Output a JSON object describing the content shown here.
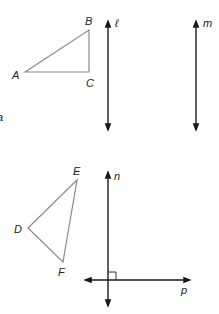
{
  "figure": {
    "width": 219,
    "height": 314,
    "colors": {
      "triangle_stroke": "#8a8a8a",
      "line_stroke": "#1a1a1a",
      "label": "#222222",
      "background": "#ffffff"
    },
    "triangles": [
      {
        "name": "ABC",
        "vertices": [
          {
            "label": "A",
            "x": 25,
            "y": 72,
            "lx": 12,
            "ly": 79
          },
          {
            "label": "B",
            "x": 89,
            "y": 30,
            "lx": 85,
            "ly": 25
          },
          {
            "label": "C",
            "x": 89,
            "y": 72,
            "lx": 86,
            "ly": 87
          }
        ]
      },
      {
        "name": "DEF",
        "vertices": [
          {
            "label": "E",
            "x": 77,
            "y": 180,
            "lx": 73,
            "ly": 175
          },
          {
            "label": "D",
            "x": 28,
            "y": 228,
            "lx": 14,
            "ly": 233
          },
          {
            "label": "F",
            "x": 63,
            "y": 262,
            "lx": 58,
            "ly": 276
          }
        ]
      }
    ],
    "lines": [
      {
        "label": "ℓ",
        "x1": 108,
        "y1": 21,
        "x2": 108,
        "y2": 130,
        "lx": 115,
        "ly": 27
      },
      {
        "label": "m",
        "x1": 196,
        "y1": 21,
        "x2": 196,
        "y2": 130,
        "lx": 203,
        "ly": 27
      },
      {
        "label": "n",
        "x1": 108,
        "y1": 172,
        "x2": 108,
        "y2": 306,
        "lx": 114,
        "ly": 180
      },
      {
        "label": "p",
        "x1": 85,
        "y1": 280,
        "x2": 190,
        "y2": 280,
        "lx": 181,
        "ly": 294
      }
    ],
    "right_angle": {
      "x": 108,
      "y": 272,
      "size": 8
    },
    "edge_fragment": {
      "label": "a",
      "x": -3,
      "y": 121
    }
  }
}
